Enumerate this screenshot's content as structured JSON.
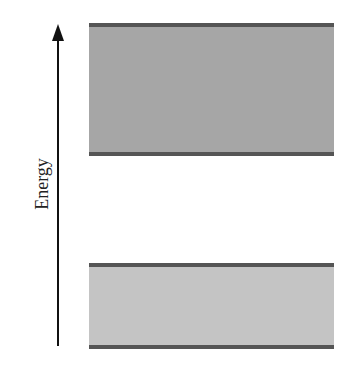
{
  "diagram": {
    "type": "energy-band-diagram",
    "axis": {
      "label": "Energy",
      "direction": "up"
    },
    "bands": [
      {
        "name": "upper-band",
        "fill": "#a6a6a6",
        "edge": "#555555"
      },
      {
        "name": "lower-band",
        "fill": "#c4c4c4",
        "edge": "#555555"
      }
    ],
    "colors": {
      "background": "#ffffff",
      "axis": "#111111"
    }
  }
}
